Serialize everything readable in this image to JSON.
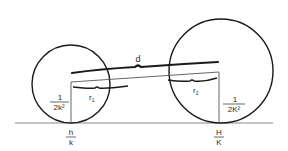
{
  "diagram": {
    "labels": {
      "distance": "d",
      "r1": "r",
      "r1_sub": "1",
      "r2": "r",
      "r2_sub": "2",
      "left_height_num": "1",
      "left_height_den": "2k²",
      "right_height_num": "1",
      "right_height_den": "2K²",
      "left_pos_num": "h",
      "left_pos_den": "k",
      "right_pos_num": "H",
      "right_pos_den": "K"
    },
    "colors": {
      "stroke": "#1a1a1a",
      "thin": "#444444",
      "baseline": "#888888"
    }
  }
}
